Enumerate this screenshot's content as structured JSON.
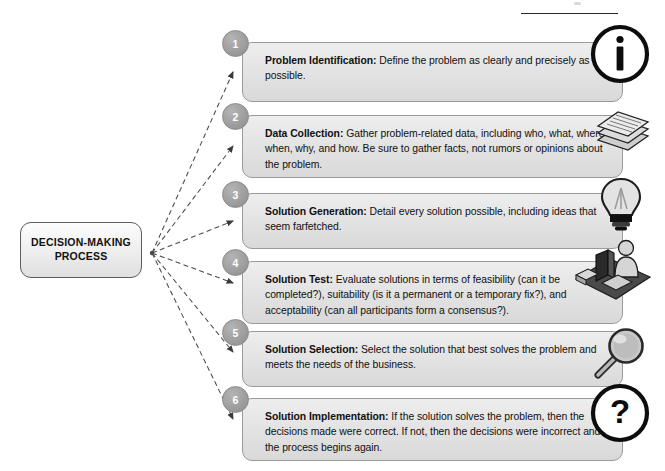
{
  "diagram": {
    "title": "Decision-Making Process",
    "root": {
      "label_line1": "DECISION-MAKING",
      "label_line2": "PROCESS"
    },
    "steps": [
      {
        "number": "1",
        "heading": "Problem Identification:",
        "body": " Define the problem as clearly and precisely as possible.",
        "icon": "info-circle-icon"
      },
      {
        "number": "2",
        "heading": "Data Collection:",
        "body": " Gather problem-related data, including who, what, where, when, why, and how.  Be sure to gather facts, not rumors or opinions about the problem.",
        "icon": "document-stack-icon"
      },
      {
        "number": "3",
        "heading": "Solution Generation:",
        "body": " Detail every solution possible, including ideas that seem farfetched.",
        "icon": "lightbulb-icon"
      },
      {
        "number": "4",
        "heading": "Solution Test:",
        "body": " Evaluate solutions in terms of feasibility (can it be completed?), suitability (is it a permanent or a temporary fix?), and acceptability (can all participants form a consensus?).",
        "icon": "person-at-computer-icon"
      },
      {
        "number": "5",
        "heading": "Solution Selection:",
        "body": " Select the solution that best solves the problem and meets the needs of the business.",
        "icon": "magnifying-glass-icon"
      },
      {
        "number": "6",
        "heading": "Solution Implementation:",
        "body": " If the solution solves the problem, then the decisions made were correct.  If not, then the decisions were incorrect and the process begins again.",
        "icon": "question-circle-icon"
      }
    ],
    "colors": {
      "badge_fill": "#9f9f9f",
      "card_fill": "#e4e4e4",
      "card_border": "#9a9a9a",
      "root_border": "#5d5d5d",
      "connector": "#4a4a4a",
      "text": "#101010"
    }
  }
}
